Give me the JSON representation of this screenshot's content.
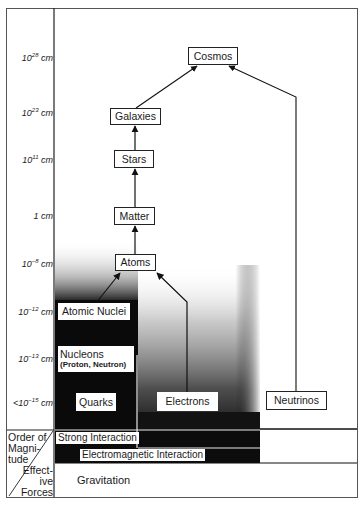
{
  "diagram": {
    "title": "",
    "y_axis": {
      "labels": [
        {
          "base": "10",
          "exp": "28",
          "unit": "cm",
          "y": 57
        },
        {
          "base": "10",
          "exp": "23",
          "unit": "cm",
          "y": 112
        },
        {
          "base": "10",
          "exp": "11",
          "unit": "cm",
          "y": 159
        },
        {
          "base": "1",
          "exp": "",
          "unit": "cm",
          "y": 215
        },
        {
          "base": "10",
          "exp": "−8",
          "unit": "cm",
          "y": 263
        },
        {
          "base": "10",
          "exp": "−12",
          "unit": "cm",
          "y": 311
        },
        {
          "base": "10",
          "exp": "−13",
          "unit": "cm",
          "y": 358
        },
        {
          "base": "<10",
          "exp": "−15",
          "unit": "cm",
          "y": 402
        }
      ]
    },
    "nodes": {
      "cosmos": "Cosmos",
      "galaxies": "Galaxies",
      "stars": "Stars",
      "matter": "Matter",
      "atoms": "Atoms",
      "atomic_nuclei": "Atomic Nuclei",
      "nucleons": "Nucleons",
      "nucleons_sub": "(Proton, Neutron)",
      "quarks": "Quarks",
      "electrons": "Electrons",
      "neutrinos": "Neutrinos"
    },
    "edges": [
      {
        "from": "galaxies",
        "to": "cosmos"
      },
      {
        "from": "neutrinos",
        "to": "cosmos"
      },
      {
        "from": "stars",
        "to": "galaxies"
      },
      {
        "from": "matter",
        "to": "stars"
      },
      {
        "from": "atoms",
        "to": "matter"
      },
      {
        "from": "atomic_nuclei",
        "to": "atoms"
      },
      {
        "from": "electrons",
        "to": "atoms"
      }
    ],
    "forces": {
      "strong": "Strong Interaction",
      "electromagnetic": "Electromagnetic Interaction",
      "gravitation": "Gravitation"
    },
    "corner": {
      "top_line1": "Order of",
      "top_line2": "Magni-",
      "top_line3": "tude",
      "bottom_line1": "Effect-",
      "bottom_line2": "ive",
      "bottom_line3": "Forces"
    },
    "colors": {
      "ink": "#1a1a1a",
      "strong_region": "#0a0a0a",
      "background": "#ffffff"
    }
  }
}
